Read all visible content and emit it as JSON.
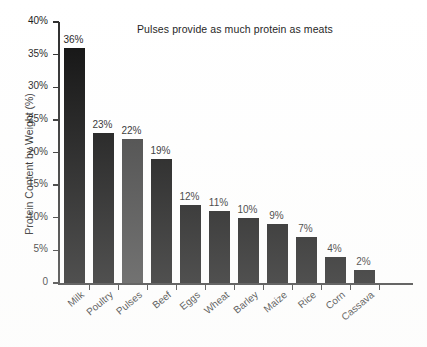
{
  "chart_data": {
    "type": "bar",
    "title": "Pulses provide as much protein as meats",
    "xlabel": "",
    "ylabel": "Protein Content by Weight (%)",
    "ylim": [
      0,
      40
    ],
    "grid": false,
    "legend": "none",
    "y_ticks": [
      "0",
      "5%",
      "10%",
      "15%",
      "20%",
      "25%",
      "30%",
      "35%",
      "40%"
    ],
    "y_tick_values": [
      0,
      5,
      10,
      15,
      20,
      25,
      30,
      35,
      40
    ],
    "categories": [
      "Milk",
      "Poultry",
      "Pulses",
      "Beef",
      "Eggs",
      "Wheat",
      "Barley",
      "Maize",
      "Rice",
      "Corn",
      "Cassava"
    ],
    "values": [
      36,
      23,
      22,
      19,
      12,
      11,
      10,
      9,
      7,
      4,
      2
    ],
    "value_labels": [
      "36%",
      "23%",
      "22%",
      "19%",
      "12%",
      "11%",
      "10%",
      "9%",
      "7%",
      "4%",
      "2%"
    ],
    "bar_colors": [
      "#0d0d0d",
      "#0d0d0d",
      "#3d3d3d",
      "#0d0d0d",
      "#0d0d0d",
      "#0d0d0d",
      "#0d0d0d",
      "#0d0d0d",
      "#0d0d0d",
      "#0d0d0d",
      "#0d0d0d"
    ],
    "highlight_category": "Pulses",
    "highlight_color": "#3d3d3d",
    "default_bar_color": "#0d0d0d",
    "axis_color": "#2b2b2b",
    "background_color": "#ffffff"
  }
}
